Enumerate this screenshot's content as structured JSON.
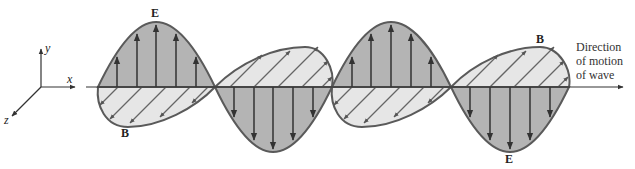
{
  "diagram": {
    "axes": {
      "x_label": "x",
      "y_label": "y",
      "z_label": "z"
    },
    "field_labels": {
      "E_top": "E",
      "B_bottom": "B",
      "B_top": "B",
      "E_bottom": "E"
    },
    "direction_text": [
      "Direction",
      "of motion",
      "of wave"
    ],
    "colors": {
      "E_fill": "#b4b4b4",
      "B_fill": "#e6e6e6",
      "outline": "#5a5a5a",
      "arrow": "#3a3a3a",
      "axis": "#333333"
    }
  }
}
